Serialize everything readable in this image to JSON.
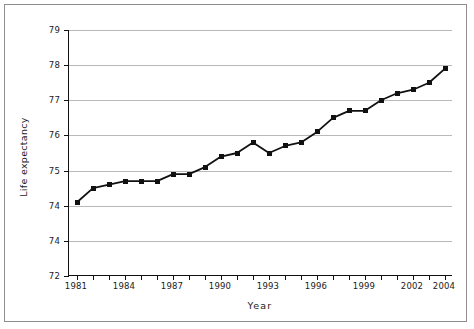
{
  "figure": {
    "xaxis_title": "Year",
    "yaxis_title": "Life expectancy",
    "border_color": "#8e8e8e",
    "grid_color": "#b9b9b9",
    "series_color": "#111111"
  },
  "chart_data": {
    "type": "line",
    "title": "",
    "xlabel": "Year",
    "ylabel": "Life expectancy",
    "x": [
      1981,
      1982,
      1983,
      1984,
      1985,
      1986,
      1987,
      1988,
      1989,
      1990,
      1991,
      1992,
      1993,
      1994,
      1995,
      1996,
      1997,
      1998,
      1999,
      2000,
      2001,
      2002,
      2003,
      2004
    ],
    "values": [
      74.1,
      74.5,
      74.6,
      74.7,
      74.7,
      74.7,
      74.9,
      74.9,
      75.1,
      75.4,
      75.5,
      75.8,
      75.5,
      75.7,
      75.8,
      76.1,
      76.5,
      76.7,
      76.7,
      77.0,
      77.2,
      77.3,
      77.5,
      77.9
    ],
    "series": [
      {
        "name": "Life expectancy",
        "values": [
          74.1,
          74.5,
          74.6,
          74.7,
          74.7,
          74.7,
          74.9,
          74.9,
          75.1,
          75.4,
          75.5,
          75.8,
          75.5,
          75.7,
          75.8,
          76.1,
          76.5,
          76.7,
          76.7,
          77.0,
          77.2,
          77.3,
          77.5,
          77.9
        ]
      }
    ],
    "xlim": [
      1980.5,
      2004.5
    ],
    "ylim": [
      72,
      79
    ],
    "grid": true,
    "legend": "none",
    "marker": "square",
    "ytick_labels": [
      "79",
      "78",
      "77",
      "76",
      "75",
      "74",
      "74",
      "72"
    ],
    "ytick_positions": [
      79,
      78,
      77,
      76,
      75,
      74,
      73,
      72
    ],
    "xtick_values": [
      1981,
      1982,
      1983,
      1984,
      1985,
      1986,
      1987,
      1988,
      1989,
      1990,
      1991,
      1992,
      1993,
      1994,
      1995,
      1996,
      1997,
      1998,
      1999,
      2000,
      2001,
      2002,
      2003,
      2004
    ],
    "xtick_labels": [
      "1981",
      "",
      "",
      "1984",
      "",
      "",
      "1987",
      "",
      "",
      "1990",
      "",
      "",
      "1993",
      "",
      "",
      "1996",
      "",
      "",
      "1999",
      "",
      "",
      "2002",
      "",
      "2004"
    ]
  }
}
